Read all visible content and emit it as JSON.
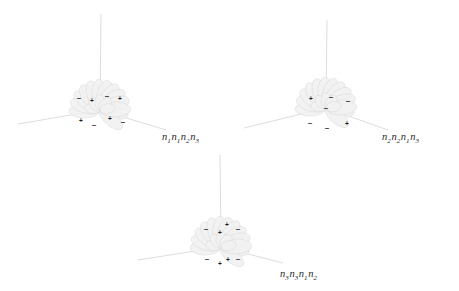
{
  "figure": {
    "background": "#ffffff",
    "axis_color": "#cfcfcf",
    "lobe_fill": "#f2f2f2",
    "lobe_stroke": "#d8d8d8",
    "sign_color": "#1c1c1c",
    "label_color": "#2b2b2b",
    "type": "orbital-lobe-diagram",
    "panel_count": 3
  },
  "panels": [
    {
      "id": "panel-1",
      "label_text": "n1n1n2n3",
      "label_parts": [
        {
          "base": "n",
          "sub": "1"
        },
        {
          "base": "n",
          "sub": "1"
        },
        {
          "base": "n",
          "sub": "2"
        },
        {
          "base": "n",
          "sub": "3"
        }
      ],
      "left": 0,
      "top": 0,
      "label_x": 162,
      "label_y": 131,
      "center_x": 100,
      "center_y": 110,
      "axes": [
        {
          "name": "vertical-axis",
          "x1": 100,
          "y1": 110,
          "x2": 101,
          "y2": 14
        },
        {
          "name": "left-axis",
          "x1": 100,
          "y1": 110,
          "x2": 18,
          "y2": 124
        },
        {
          "name": "right-axis",
          "x1": 100,
          "y1": 110,
          "x2": 166,
          "y2": 130
        }
      ],
      "lobes_upper": [
        {
          "sign": "-",
          "x": 79,
          "y": 98
        },
        {
          "sign": "+",
          "x": 92,
          "y": 101
        },
        {
          "sign": "-",
          "x": 107,
          "y": 96
        },
        {
          "sign": "+",
          "x": 120,
          "y": 99
        }
      ],
      "lobes_lower": [
        {
          "sign": "+",
          "x": 81,
          "y": 121
        },
        {
          "sign": "-",
          "x": 94,
          "y": 125
        },
        {
          "sign": "+",
          "x": 110,
          "y": 119
        },
        {
          "sign": "-",
          "x": 123,
          "y": 122
        }
      ]
    },
    {
      "id": "panel-2",
      "label_text": "n2n2n1n3",
      "label_parts": [
        {
          "base": "n",
          "sub": "2"
        },
        {
          "base": "n",
          "sub": "2"
        },
        {
          "base": "n",
          "sub": "1"
        },
        {
          "base": "n",
          "sub": "3"
        }
      ],
      "left": 230,
      "top": 0,
      "label_x": 382,
      "label_y": 131,
      "center_x": 96,
      "center_y": 108,
      "axes": [
        {
          "name": "vertical-axis",
          "x1": 96,
          "y1": 108,
          "x2": 97,
          "y2": 20
        },
        {
          "name": "left-axis",
          "x1": 96,
          "y1": 108,
          "x2": 14,
          "y2": 128
        },
        {
          "name": "right-axis",
          "x1": 96,
          "y1": 108,
          "x2": 158,
          "y2": 130
        }
      ],
      "lobes_upper": [
        {
          "sign": "+",
          "x": 81,
          "y": 99
        },
        {
          "sign": "-",
          "x": 101,
          "y": 97
        },
        {
          "sign": "-",
          "x": 118,
          "y": 101
        },
        {
          "sign": "-",
          "x": 96,
          "y": 108
        }
      ],
      "lobes_lower": [
        {
          "sign": "-",
          "x": 80,
          "y": 123
        },
        {
          "sign": "-",
          "x": 97,
          "y": 128
        },
        {
          "sign": "+",
          "x": 117,
          "y": 124
        }
      ]
    },
    {
      "id": "panel-3",
      "label_text": "n3n3n1n2",
      "label_parts": [
        {
          "base": "n",
          "sub": "3"
        },
        {
          "base": "n",
          "sub": "3"
        },
        {
          "base": "n",
          "sub": "1"
        },
        {
          "base": "n",
          "sub": "2"
        }
      ],
      "left": 120,
      "top": 150,
      "label_x": 280,
      "label_y": 268,
      "center_x": 101,
      "center_y": 97,
      "axes": [
        {
          "name": "vertical-axis",
          "x1": 101,
          "y1": 97,
          "x2": 100,
          "y2": 5
        },
        {
          "name": "left-axis",
          "x1": 101,
          "y1": 97,
          "x2": 18,
          "y2": 110
        },
        {
          "name": "right-axis",
          "x1": 101,
          "y1": 97,
          "x2": 163,
          "y2": 113
        }
      ],
      "lobes_upper": [
        {
          "sign": "-",
          "x": 86,
          "y": 79
        },
        {
          "sign": "+",
          "x": 100,
          "y": 83
        },
        {
          "sign": "+",
          "x": 107,
          "y": 75
        },
        {
          "sign": "-",
          "x": 118,
          "y": 79
        }
      ],
      "lobes_lower": [
        {
          "sign": "-",
          "x": 87,
          "y": 109
        },
        {
          "sign": "+",
          "x": 100,
          "y": 114
        },
        {
          "sign": "+",
          "x": 108,
          "y": 110
        },
        {
          "sign": "-",
          "x": 118,
          "y": 109
        }
      ]
    }
  ]
}
